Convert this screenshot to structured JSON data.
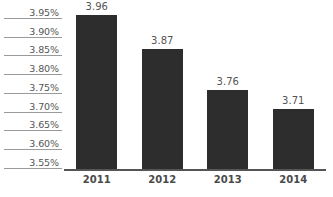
{
  "chart_data": {
    "type": "bar",
    "title": "",
    "subtitle": "",
    "xlabel": "",
    "ylabel": "",
    "categories": [
      "2011",
      "2012",
      "2013",
      "2014"
    ],
    "values": [
      3.96,
      3.87,
      3.76,
      3.71
    ],
    "data_labels": [
      "3.96",
      "3.87",
      "3.76",
      "3.71"
    ],
    "ylim": [
      3.55,
      4.0
    ],
    "ytick_values": [
      4.0,
      3.95,
      3.9,
      3.85,
      3.8,
      3.75,
      3.7,
      3.65,
      3.6,
      3.55
    ],
    "ytick_labels": [
      "4.00%",
      "3.95%",
      "3.90%",
      "3.85%",
      "3.80%",
      "3.75%",
      "3.70%",
      "3.65%",
      "3.60%",
      "3.55%"
    ],
    "grid": false,
    "legend": false,
    "legend_position": "none",
    "series": [
      {
        "name": "",
        "values": [
          3.96,
          3.87,
          3.76,
          3.71
        ]
      }
    ],
    "colors": {
      "bar": "#2d2d2d",
      "axis": "#555555",
      "tick_rule": "#9a9a9a",
      "label_text": "#555555",
      "category_text": "#4a4a4a",
      "background": "#ffffff"
    }
  }
}
